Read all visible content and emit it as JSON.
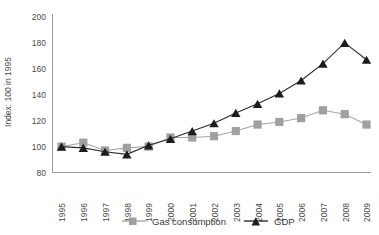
{
  "chart_data": {
    "type": "line",
    "title": "",
    "subtitle": "",
    "xlabel": "",
    "ylabel": "Index: 100 in 1995",
    "categories": [
      "1995",
      "1996",
      "1997",
      "1998",
      "1999",
      "2000",
      "2001",
      "2002",
      "2003",
      "2004",
      "2005",
      "2006",
      "2007",
      "2008",
      "2009"
    ],
    "ylim": [
      80,
      200
    ],
    "yticks": [
      80,
      100,
      120,
      140,
      160,
      180,
      200
    ],
    "ytick_labels": [
      "80",
      "100",
      "120",
      "140",
      "160",
      "180",
      "200"
    ],
    "grid": false,
    "legend_position": "bottom",
    "series": [
      {
        "name": "Gas consumption",
        "marker": "square",
        "color": "#a0a0a0",
        "values": [
          100,
          103,
          97,
          99,
          100,
          107,
          107,
          108,
          112,
          117,
          119,
          122,
          128,
          125,
          117
        ]
      },
      {
        "name": "GDP",
        "marker": "triangle",
        "color": "#1c1c1c",
        "values": [
          100,
          99,
          96,
          94,
          101,
          106,
          112,
          118,
          126,
          133,
          141,
          151,
          164,
          180,
          167
        ]
      }
    ],
    "legend": [
      {
        "label": "Gas consumption",
        "marker": "square",
        "color": "#a0a0a0"
      },
      {
        "label": "GDP",
        "marker": "triangle",
        "color": "#1c1c1c"
      }
    ],
    "annotations": []
  }
}
